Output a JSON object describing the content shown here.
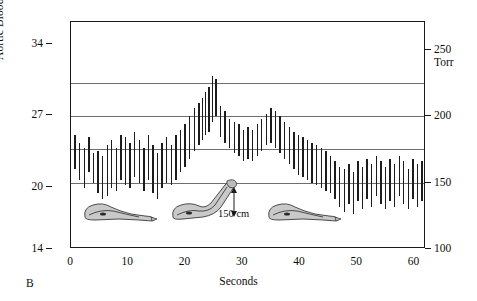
{
  "panel": {
    "label": "B"
  },
  "chart_data": {
    "type": "line",
    "title": "Giraffe",
    "xlabel": "Seconds",
    "ylabel": "Aortic Blood Pressure (kPa)",
    "ylabel_right": "Torr",
    "xlim": [
      0,
      62
    ],
    "ylim_kpa": [
      14,
      36.1
    ],
    "ylim_torr": [
      100,
      271
    ],
    "xticks": [
      0,
      10,
      20,
      30,
      40,
      50,
      60
    ],
    "yticks_kpa": [
      14,
      20,
      27,
      34
    ],
    "yticks_torr": [
      100,
      150,
      200,
      250
    ],
    "gridlines_torr": [
      150,
      175,
      200,
      225
    ],
    "grid": true,
    "legend": "none",
    "series_description": "Beat-by-beat systolic/diastolic aortic pressure bars",
    "annotations": [
      {
        "text": "150 cm",
        "meaning": "head elevation above heart when raised"
      },
      {
        "text": "Giraffe",
        "meaning": "species label"
      }
    ],
    "phases": [
      {
        "name": "head down",
        "x_range": [
          0,
          22
        ],
        "mean_torr": 175
      },
      {
        "name": "head raised",
        "x_range": [
          22,
          47
        ],
        "mean_torr": 196
      },
      {
        "name": "head lowered again",
        "x_range": [
          47,
          62
        ],
        "mean_torr": 157
      }
    ],
    "beats": [
      {
        "t": 0.6,
        "sys": 186,
        "dia": 160
      },
      {
        "t": 1.4,
        "sys": 180,
        "dia": 152
      },
      {
        "t": 2.2,
        "sys": 176,
        "dia": 146
      },
      {
        "t": 3.0,
        "sys": 184,
        "dia": 158
      },
      {
        "t": 3.8,
        "sys": 172,
        "dia": 150
      },
      {
        "t": 4.6,
        "sys": 174,
        "dia": 142
      },
      {
        "t": 5.4,
        "sys": 170,
        "dia": 138
      },
      {
        "t": 6.2,
        "sys": 178,
        "dia": 140
      },
      {
        "t": 7.0,
        "sys": 182,
        "dia": 146
      },
      {
        "t": 7.8,
        "sys": 176,
        "dia": 144
      },
      {
        "t": 8.6,
        "sys": 186,
        "dia": 152
      },
      {
        "t": 9.4,
        "sys": 184,
        "dia": 148
      },
      {
        "t": 10.2,
        "sys": 180,
        "dia": 146
      },
      {
        "t": 11.0,
        "sys": 188,
        "dia": 154
      },
      {
        "t": 11.8,
        "sys": 182,
        "dia": 150
      },
      {
        "t": 12.6,
        "sys": 176,
        "dia": 144
      },
      {
        "t": 13.4,
        "sys": 186,
        "dia": 152
      },
      {
        "t": 14.2,
        "sys": 178,
        "dia": 142
      },
      {
        "t": 15.0,
        "sys": 172,
        "dia": 138
      },
      {
        "t": 15.8,
        "sys": 180,
        "dia": 146
      },
      {
        "t": 16.6,
        "sys": 184,
        "dia": 150
      },
      {
        "t": 17.4,
        "sys": 178,
        "dia": 148
      },
      {
        "t": 18.2,
        "sys": 186,
        "dia": 152
      },
      {
        "t": 19.0,
        "sys": 190,
        "dia": 158
      },
      {
        "t": 19.8,
        "sys": 194,
        "dia": 162
      },
      {
        "t": 20.6,
        "sys": 200,
        "dia": 168
      },
      {
        "t": 21.4,
        "sys": 206,
        "dia": 174
      },
      {
        "t": 22.2,
        "sys": 210,
        "dia": 178
      },
      {
        "t": 22.8,
        "sys": 214,
        "dia": 182
      },
      {
        "t": 23.4,
        "sys": 218,
        "dia": 186
      },
      {
        "t": 24.0,
        "sys": 222,
        "dia": 188
      },
      {
        "t": 24.6,
        "sys": 230,
        "dia": 196
      },
      {
        "t": 25.2,
        "sys": 228,
        "dia": 200
      },
      {
        "t": 26.0,
        "sys": 208,
        "dia": 184
      },
      {
        "t": 26.8,
        "sys": 204,
        "dia": 180
      },
      {
        "t": 27.6,
        "sys": 198,
        "dia": 176
      },
      {
        "t": 28.4,
        "sys": 196,
        "dia": 172
      },
      {
        "t": 29.2,
        "sys": 194,
        "dia": 170
      },
      {
        "t": 30.0,
        "sys": 190,
        "dia": 166
      },
      {
        "t": 30.8,
        "sys": 192,
        "dia": 168
      },
      {
        "t": 31.6,
        "sys": 190,
        "dia": 166
      },
      {
        "t": 32.4,
        "sys": 194,
        "dia": 170
      },
      {
        "t": 33.2,
        "sys": 198,
        "dia": 174
      },
      {
        "t": 34.0,
        "sys": 202,
        "dia": 178
      },
      {
        "t": 34.8,
        "sys": 206,
        "dia": 180
      },
      {
        "t": 35.6,
        "sys": 204,
        "dia": 176
      },
      {
        "t": 36.4,
        "sys": 200,
        "dia": 172
      },
      {
        "t": 37.2,
        "sys": 196,
        "dia": 168
      },
      {
        "t": 38.0,
        "sys": 192,
        "dia": 164
      },
      {
        "t": 38.8,
        "sys": 188,
        "dia": 160
      },
      {
        "t": 39.6,
        "sys": 186,
        "dia": 156
      },
      {
        "t": 40.4,
        "sys": 184,
        "dia": 154
      },
      {
        "t": 41.2,
        "sys": 182,
        "dia": 152
      },
      {
        "t": 42.0,
        "sys": 180,
        "dia": 150
      },
      {
        "t": 42.8,
        "sys": 178,
        "dia": 148
      },
      {
        "t": 43.6,
        "sys": 176,
        "dia": 146
      },
      {
        "t": 44.4,
        "sys": 174,
        "dia": 144
      },
      {
        "t": 45.2,
        "sys": 170,
        "dia": 142
      },
      {
        "t": 46.0,
        "sys": 166,
        "dia": 138
      },
      {
        "t": 46.8,
        "sys": 162,
        "dia": 132
      },
      {
        "t": 47.6,
        "sys": 160,
        "dia": 128
      },
      {
        "t": 48.4,
        "sys": 164,
        "dia": 134
      },
      {
        "t": 49.2,
        "sys": 158,
        "dia": 126
      },
      {
        "t": 50.0,
        "sys": 166,
        "dia": 136
      },
      {
        "t": 50.8,
        "sys": 162,
        "dia": 130
      },
      {
        "t": 51.6,
        "sys": 168,
        "dia": 138
      },
      {
        "t": 52.4,
        "sys": 164,
        "dia": 132
      },
      {
        "t": 53.2,
        "sys": 170,
        "dia": 140
      },
      {
        "t": 54.0,
        "sys": 166,
        "dia": 134
      },
      {
        "t": 54.8,
        "sys": 162,
        "dia": 130
      },
      {
        "t": 55.6,
        "sys": 168,
        "dia": 136
      },
      {
        "t": 56.4,
        "sys": 164,
        "dia": 132
      },
      {
        "t": 57.2,
        "sys": 170,
        "dia": 140
      },
      {
        "t": 58.0,
        "sys": 166,
        "dia": 134
      },
      {
        "t": 58.8,
        "sys": 160,
        "dia": 130
      },
      {
        "t": 59.6,
        "sys": 168,
        "dia": 138
      },
      {
        "t": 60.4,
        "sys": 164,
        "dia": 132
      },
      {
        "t": 61.2,
        "sys": 166,
        "dia": 136
      }
    ]
  },
  "giraffes": [
    {
      "name": "giraffe-head-down-left",
      "x": 78,
      "posture": "head down"
    },
    {
      "name": "giraffe-head-raised",
      "x": 168,
      "posture": "head raised 150 cm"
    },
    {
      "name": "giraffe-head-down-right",
      "x": 262,
      "posture": "head down"
    }
  ]
}
